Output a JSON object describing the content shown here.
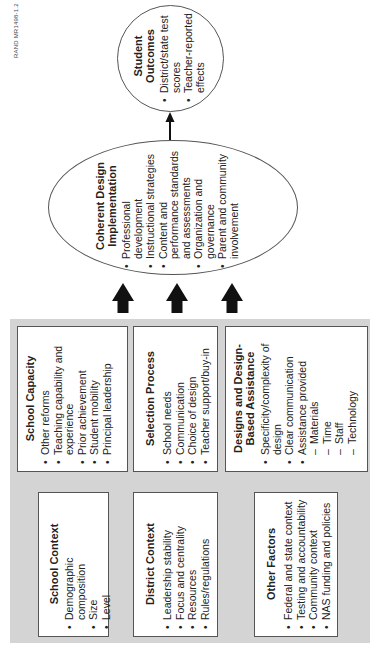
{
  "figure_label": "RAND MR1498-1.2",
  "inputs": {
    "school_capacity": {
      "title": "School Capacity",
      "items": [
        "Other reforms",
        "Teaching capability and experience",
        "Prior achievement",
        "Student mobility",
        "Principal leadership"
      ]
    },
    "selection_process": {
      "title": "Selection Process",
      "items": [
        "School needs",
        "Communication",
        "Choice of design",
        "Teacher support/buy-in"
      ]
    },
    "designs_assistance": {
      "title": "Designs and Design-Based Assistance",
      "items": [
        "Specificity/complexity of design",
        "Clear communication",
        "Assistance provided"
      ],
      "sub_items": [
        "Materials",
        "Time",
        "Staff",
        "Technology"
      ]
    },
    "school_context": {
      "title": "School Context",
      "items": [
        "Demographic composition",
        "Size",
        "Level"
      ]
    },
    "district_context": {
      "title": "District Context",
      "items": [
        "Leadership stability",
        "Focus and centrality",
        "Resources",
        "Rules/regulations"
      ]
    },
    "other_factors": {
      "title": "Other Factors",
      "items": [
        "Federal and state context",
        "Testing and accountability",
        "Community context",
        "NAS funding and policies"
      ]
    }
  },
  "implementation": {
    "title": "Coherent Design Implementation",
    "items": [
      "Professional development",
      "Instructional strategies",
      "Content and performance standards and assessments",
      "Organization and governance",
      "Parent and community involvement"
    ]
  },
  "outcomes": {
    "title": "Student Outcomes",
    "items": [
      "District/state test scores",
      "Teacher-reported effects"
    ]
  },
  "colors": {
    "panel": "#d4d4d4",
    "border": "#555555",
    "arrow": "#111111"
  }
}
